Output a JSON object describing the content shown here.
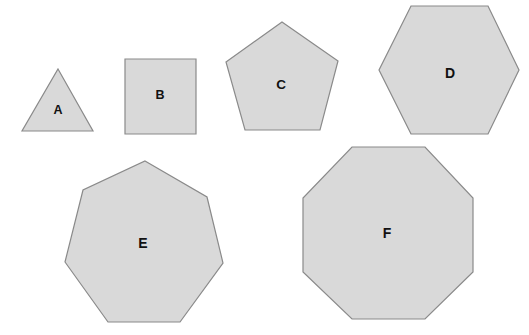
{
  "figure": {
    "background_color": "#ffffff",
    "fill_color": "#d9d9d9",
    "stroke_color": "#8a8a8a",
    "label_color": "#111111",
    "width": 529,
    "height": 335
  },
  "shapes": [
    {
      "id": "a",
      "label": "A",
      "name": "triangle",
      "sides": 3,
      "points": "58,69 93,131 22,131",
      "label_x": 58,
      "label_y": 110
    },
    {
      "id": "b",
      "label": "B",
      "name": "square",
      "sides": 4,
      "points": "125,59 196,59 196,134 125,134",
      "label_x": 160,
      "label_y": 95
    },
    {
      "id": "c",
      "label": "C",
      "name": "pentagon",
      "sides": 5,
      "points": "282,22 338,61 320,130 245,130 226,62",
      "label_x": 281,
      "label_y": 84
    },
    {
      "id": "d",
      "label": "D",
      "name": "hexagon",
      "sides": 6,
      "points": "411,6 488,6 519,70 488,134 411,134 379,70",
      "label_x": 450,
      "label_y": 73
    },
    {
      "id": "e",
      "label": "E",
      "name": "heptagon",
      "sides": 7,
      "points": "145,161 207,197 223,263 180,322 108,322 65,262 83,190",
      "label_x": 143,
      "label_y": 243
    },
    {
      "id": "f",
      "label": "F",
      "name": "octagon",
      "sides": 8,
      "points": "352,147 425,147 473,198 473,272 425,319 352,319 303,272 303,198",
      "label_x": 387,
      "label_y": 233
    }
  ]
}
